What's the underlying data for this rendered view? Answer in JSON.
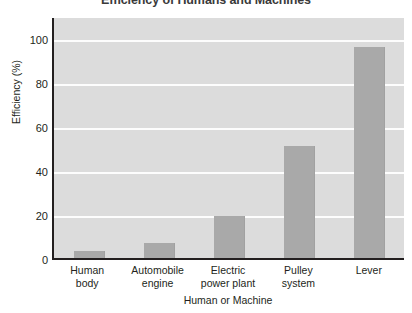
{
  "chart_data": {
    "type": "bar",
    "title": "Efficiency of Humans and Machines",
    "xlabel": "Human or Machine",
    "ylabel": "Efficiency (%)",
    "categories": [
      "Human body",
      "Automobile engine",
      "Electric power plant",
      "Pulley system",
      "Lever"
    ],
    "category_lines": [
      [
        "Human",
        "body"
      ],
      [
        "Automobile",
        "engine"
      ],
      [
        "Electric",
        "power plant"
      ],
      [
        "Pulley",
        "system"
      ],
      [
        "Lever",
        ""
      ]
    ],
    "values": [
      3,
      7,
      19,
      51,
      96
    ],
    "ylim": [
      0,
      110
    ],
    "yticks": [
      0,
      20,
      40,
      60,
      80,
      100
    ],
    "ytick_labels": [
      "0",
      "20",
      "40",
      "60",
      "80",
      "100"
    ],
    "grid": true,
    "legend": "none",
    "colors": {
      "bar": "#a9a9a9",
      "plot_background": "#dcdcdc",
      "gridline": "#fdfdfd",
      "axis": "#231f20",
      "title_text": "#3a3a3a",
      "label_text": "#231f20",
      "page_background": "#ffffff"
    }
  }
}
